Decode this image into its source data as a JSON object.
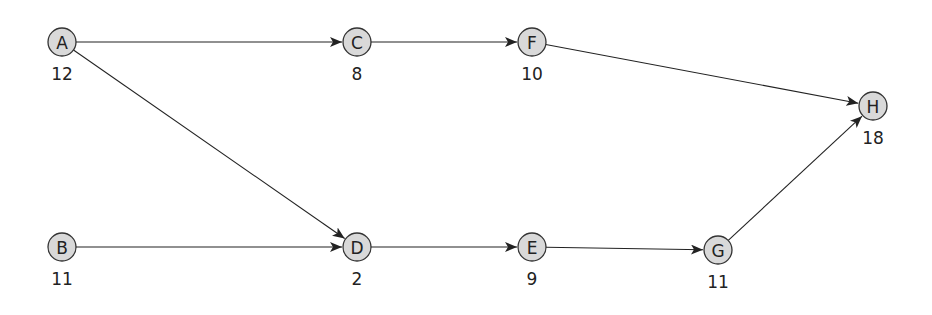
{
  "diagram": {
    "type": "directed-network",
    "nodes": [
      {
        "id": "A",
        "label": "A",
        "value": "12",
        "x": 62,
        "y": 42
      },
      {
        "id": "C",
        "label": "C",
        "value": "8",
        "x": 357,
        "y": 42
      },
      {
        "id": "F",
        "label": "F",
        "value": "10",
        "x": 532,
        "y": 42
      },
      {
        "id": "H",
        "label": "H",
        "value": "18",
        "x": 873,
        "y": 106
      },
      {
        "id": "B",
        "label": "B",
        "value": "11",
        "x": 62,
        "y": 247
      },
      {
        "id": "D",
        "label": "D",
        "value": "2",
        "x": 357,
        "y": 247
      },
      {
        "id": "E",
        "label": "E",
        "value": "9",
        "x": 532,
        "y": 247
      },
      {
        "id": "G",
        "label": "G",
        "value": "11",
        "x": 718,
        "y": 250
      }
    ],
    "edges": [
      {
        "from": "A",
        "to": "C"
      },
      {
        "from": "A",
        "to": "D"
      },
      {
        "from": "C",
        "to": "F"
      },
      {
        "from": "F",
        "to": "H"
      },
      {
        "from": "B",
        "to": "D"
      },
      {
        "from": "D",
        "to": "E"
      },
      {
        "from": "E",
        "to": "G"
      },
      {
        "from": "G",
        "to": "H"
      }
    ],
    "colors": {
      "node_fill": "#d9d9d9",
      "node_stroke": "#333333",
      "edge": "#222222",
      "background": "#ffffff"
    }
  }
}
